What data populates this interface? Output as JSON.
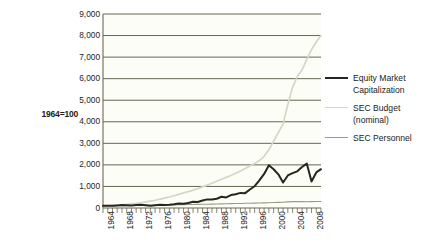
{
  "axis_title": "1964=100",
  "legend": {
    "items": [
      {
        "label": "Equity Market Capitalization",
        "color": "#262620",
        "width": 2.0,
        "name": "equity-market-capitalization"
      },
      {
        "label": "SEC Budget (nominal)",
        "color": "#d6d6c6",
        "width": 1.6,
        "name": "sec-budget-nominal"
      },
      {
        "label": "SEC Personnel",
        "color": "#9a9a86",
        "width": 1.2,
        "name": "sec-personnel"
      }
    ]
  },
  "chart_data": {
    "type": "line",
    "title": "",
    "xlabel": "",
    "ylabel": "1964=100",
    "grid": true,
    "legend_position": "right",
    "xlim": [
      1964,
      2010
    ],
    "ylim": [
      0,
      9000
    ],
    "ytick_labels": [
      "9,000",
      "8,000",
      "7,000",
      "6,000",
      "5,000",
      "4,000",
      "3,000",
      "2,000",
      "1,000",
      "0"
    ],
    "ytick_values": [
      9000,
      8000,
      7000,
      6000,
      5000,
      4000,
      3000,
      2000,
      1000,
      0
    ],
    "xtick_labels": [
      "1964",
      "1968",
      "1972",
      "1976",
      "1980",
      "1984",
      "1988",
      "1992",
      "1996",
      "2000",
      "2004",
      "2008"
    ],
    "xtick_values": [
      1964,
      1968,
      1972,
      1976,
      1980,
      1984,
      1988,
      1992,
      1996,
      2000,
      2004,
      2008
    ],
    "x": [
      1964,
      1965,
      1966,
      1967,
      1968,
      1969,
      1970,
      1971,
      1972,
      1973,
      1974,
      1975,
      1976,
      1977,
      1978,
      1979,
      1980,
      1981,
      1982,
      1983,
      1984,
      1985,
      1986,
      1987,
      1988,
      1989,
      1990,
      1991,
      1992,
      1993,
      1994,
      1995,
      1996,
      1997,
      1998,
      1999,
      2000,
      2001,
      2002,
      2003,
      2004,
      2005,
      2006,
      2007,
      2008,
      2009,
      2010
    ],
    "series": [
      {
        "name": "Equity Market Capitalization",
        "color": "#262620",
        "values": [
          100,
          110,
          105,
          120,
          135,
          125,
          115,
          135,
          150,
          130,
          100,
          130,
          150,
          140,
          150,
          170,
          210,
          200,
          230,
          290,
          280,
          350,
          400,
          390,
          430,
          520,
          490,
          600,
          640,
          700,
          690,
          860,
          1010,
          1280,
          1580,
          1980,
          1800,
          1560,
          1180,
          1510,
          1620,
          1700,
          1900,
          2060,
          1230,
          1650,
          1800
        ]
      },
      {
        "name": "SEC Budget (nominal)",
        "color": "#d6d6c6",
        "values": [
          100,
          110,
          120,
          135,
          150,
          170,
          190,
          215,
          245,
          280,
          320,
          360,
          410,
          460,
          510,
          570,
          630,
          700,
          760,
          830,
          900,
          980,
          1060,
          1150,
          1240,
          1330,
          1420,
          1510,
          1610,
          1720,
          1830,
          1950,
          2060,
          2200,
          2400,
          2700,
          3100,
          3500,
          3900,
          4800,
          5600,
          6100,
          6400,
          6900,
          7350,
          7700,
          8000
        ]
      },
      {
        "name": "SEC Personnel",
        "color": "#9a9a86",
        "values": [
          100,
          102,
          104,
          106,
          108,
          110,
          113,
          116,
          119,
          122,
          126,
          130,
          134,
          138,
          142,
          147,
          152,
          156,
          160,
          164,
          168,
          172,
          177,
          182,
          187,
          192,
          197,
          202,
          207,
          212,
          217,
          222,
          228,
          234,
          240,
          247,
          255,
          262,
          270,
          282,
          296,
          300,
          296,
          292,
          295,
          300,
          300
        ]
      }
    ]
  }
}
